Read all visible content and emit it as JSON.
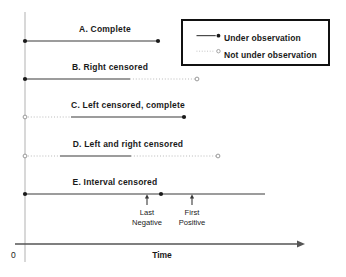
{
  "figure": {
    "background": "#ffffff",
    "solid_color": "#3a3a3a",
    "dotted_color": "#b9b9b9",
    "baseline_color": "#555555",
    "guide_color": "#cfcfcf",
    "marker_fill": "#1a1a1a",
    "marker_hollow": "#ffffff",
    "marker_hollow_stroke": "#9a9a9a"
  },
  "chart_data": {
    "type": "timeline",
    "title": "",
    "xlabel": "Time",
    "ylabel": "",
    "origin_label": "0",
    "xlim": [
      0,
      300
    ],
    "grid": false,
    "legend_position": "top-right",
    "axis": {
      "x_start_px": 15,
      "x_end_px": 305,
      "y_px": 244,
      "arrow": "right",
      "origin_tick_px": 25
    },
    "legend": [
      {
        "key": "under-observation",
        "label": "Under observation",
        "line_style": "solid",
        "marker": "filled-dot"
      },
      {
        "key": "not-under-observation",
        "label": "Not under observation",
        "line_style": "dotted",
        "marker": "hollow-dot"
      }
    ],
    "series": [
      {
        "key": "a",
        "label": "A.  Complete",
        "y_px": 41,
        "label_center_px": 105,
        "label_y_px": 25,
        "segments": [
          {
            "style": "solid",
            "x0": 25,
            "x1": 158
          }
        ],
        "markers": [
          {
            "type": "filled-dot",
            "x": 25
          },
          {
            "type": "filled-dot",
            "x": 158
          }
        ]
      },
      {
        "key": "b",
        "label": "B.  Right censored",
        "y_px": 79,
        "label_center_px": 110,
        "label_y_px": 63,
        "segments": [
          {
            "style": "solid",
            "x0": 25,
            "x1": 130
          },
          {
            "style": "dotted",
            "x0": 130,
            "x1": 197
          }
        ],
        "markers": [
          {
            "type": "filled-dot",
            "x": 25
          },
          {
            "type": "hollow-dot",
            "x": 197
          }
        ]
      },
      {
        "key": "c",
        "label": "C.  Left censored, complete",
        "y_px": 117,
        "label_center_px": 128,
        "label_y_px": 101,
        "segments": [
          {
            "style": "dotted",
            "x0": 25,
            "x1": 71
          },
          {
            "style": "solid",
            "x0": 71,
            "x1": 184
          }
        ],
        "markers": [
          {
            "type": "hollow-dot",
            "x": 25
          },
          {
            "type": "filled-dot",
            "x": 184
          }
        ]
      },
      {
        "key": "d",
        "label": "D.  Left and right censored",
        "y_px": 156,
        "label_center_px": 128,
        "label_y_px": 140,
        "segments": [
          {
            "style": "dotted",
            "x0": 25,
            "x1": 60
          },
          {
            "style": "solid",
            "x0": 60,
            "x1": 131
          },
          {
            "style": "dotted",
            "x0": 131,
            "x1": 218
          }
        ],
        "markers": [
          {
            "type": "hollow-dot",
            "x": 25
          },
          {
            "type": "hollow-dot",
            "x": 218
          }
        ]
      },
      {
        "key": "e",
        "label": "E.  Interval censored",
        "y_px": 194,
        "label_center_px": 115,
        "label_y_px": 178,
        "segments": [
          {
            "style": "solid",
            "x0": 25,
            "x1": 265
          }
        ],
        "markers": [
          {
            "type": "filled-dot",
            "x": 25
          },
          {
            "type": "filled-dot",
            "x": 161
          }
        ]
      }
    ],
    "annotations": [
      {
        "key": "last-negative",
        "line1": "Last",
        "line2": "Negative",
        "x_px": 147,
        "arrow_from_y_px": 205,
        "arrow_to_y_px": 194,
        "text_y_px": 208
      },
      {
        "key": "first-positive",
        "line1": "First",
        "line2": "Positive",
        "x_px": 192,
        "arrow_from_y_px": 205,
        "arrow_to_y_px": 194,
        "text_y_px": 208
      }
    ]
  }
}
